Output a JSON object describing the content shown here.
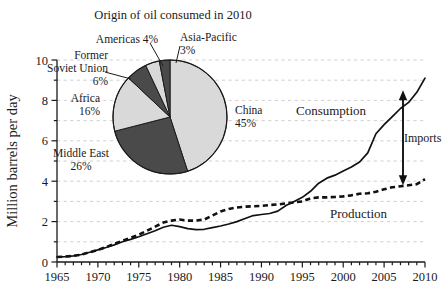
{
  "chart_data": {
    "type": "line",
    "title": "",
    "xlabel": "",
    "ylabel": "Million barrels per day",
    "xlim": [
      1965,
      2010
    ],
    "ylim": [
      0,
      10
    ],
    "y_major_step": 2,
    "y_minor_step": 1,
    "x_major_step": 5,
    "x_minor_step": 1,
    "grid": true,
    "grid_style": "dashed horizontal light-gray",
    "legend": "inline annotations",
    "x_ticks": [
      "1965",
      "1970",
      "1975",
      "1980",
      "1985",
      "1990",
      "1995",
      "2000",
      "2005",
      "2010"
    ],
    "y_ticks": [
      "0",
      "2",
      "4",
      "6",
      "8",
      "10"
    ],
    "x": [
      1965,
      1966,
      1967,
      1968,
      1969,
      1970,
      1971,
      1972,
      1973,
      1974,
      1975,
      1976,
      1977,
      1978,
      1979,
      1980,
      1981,
      1982,
      1983,
      1984,
      1985,
      1986,
      1987,
      1988,
      1989,
      1990,
      1991,
      1992,
      1993,
      1994,
      1995,
      1996,
      1997,
      1998,
      1999,
      2000,
      2001,
      2002,
      2003,
      2004,
      2005,
      2006,
      2007,
      2008,
      2009,
      2010
    ],
    "series": [
      {
        "name": "Consumption",
        "style": "solid",
        "values": [
          0.25,
          0.27,
          0.3,
          0.37,
          0.48,
          0.6,
          0.72,
          0.85,
          1.0,
          1.12,
          1.25,
          1.4,
          1.55,
          1.72,
          1.82,
          1.75,
          1.65,
          1.6,
          1.62,
          1.7,
          1.78,
          1.88,
          2.0,
          2.15,
          2.3,
          2.35,
          2.4,
          2.52,
          2.8,
          3.0,
          3.2,
          3.5,
          3.9,
          4.15,
          4.3,
          4.5,
          4.7,
          4.95,
          5.4,
          6.35,
          6.8,
          7.2,
          7.6,
          7.9,
          8.4,
          9.1
        ]
      },
      {
        "name": "Production",
        "style": "dashed",
        "values": [
          0.25,
          0.27,
          0.3,
          0.37,
          0.48,
          0.6,
          0.74,
          0.9,
          1.05,
          1.2,
          1.35,
          1.55,
          1.75,
          1.95,
          2.05,
          2.1,
          2.05,
          2.05,
          2.1,
          2.3,
          2.5,
          2.62,
          2.7,
          2.74,
          2.76,
          2.78,
          2.82,
          2.85,
          2.9,
          2.95,
          3.0,
          3.15,
          3.2,
          3.2,
          3.22,
          3.25,
          3.3,
          3.38,
          3.4,
          3.48,
          3.6,
          3.7,
          3.75,
          3.8,
          3.85,
          4.1
        ]
      }
    ],
    "annotations": [
      {
        "name": "consumption-label",
        "text": "Consumption"
      },
      {
        "name": "production-label",
        "text": "Production"
      },
      {
        "name": "imports-label",
        "text": "Imports"
      }
    ],
    "imports_arrow": {
      "year": 2010,
      "from_value": 4.1,
      "to_value": 8.2,
      "label": "Imports"
    }
  },
  "pie_chart": {
    "type": "pie",
    "title": "Origin of oil consumed in 2010",
    "slices": [
      {
        "label": "China",
        "percent": "45%",
        "value": 45,
        "color": "#d9d9d9"
      },
      {
        "label": "Middle East",
        "percent": "26%",
        "value": 26,
        "color": "#4a4a4a"
      },
      {
        "label": "Africa",
        "percent": "16%",
        "value": 16,
        "color": "#d9d9d9"
      },
      {
        "label": "Former\nSoviet Union",
        "percent": "6%",
        "value": 6,
        "color": "#4a4a4a"
      },
      {
        "label": "Americas",
        "percent": "4%",
        "value": 4,
        "color": "#d9d9d9"
      },
      {
        "label": "Asia-Pacific",
        "percent": "3%",
        "value": 3,
        "color": "#4a4a4a"
      }
    ],
    "labels": {
      "china": "China\n45%",
      "middle_east": "Middle East\n26%",
      "africa": "Africa\n16%",
      "former_soviet_union": "Former\nSoviet Union\n6%",
      "americas": "Americas 4%",
      "asia_pacific": "Asia-Pacific\n3%"
    }
  },
  "axis": {
    "y_title": "Million barrels per day"
  }
}
